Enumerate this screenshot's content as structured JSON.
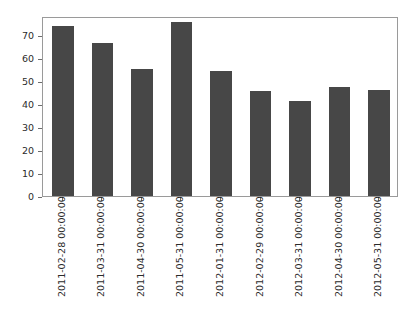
{
  "chart_data": {
    "type": "bar",
    "title": "",
    "xlabel": "",
    "ylabel": "",
    "categories": [
      "2011-02-28 00:00:00",
      "2011-03-31 00:00:00",
      "2011-04-30 00:00:00",
      "2011-05-31 00:00:00",
      "2012-01-31 00:00:00",
      "2012-02-29 00:00:00",
      "2012-03-31 00:00:00",
      "2012-04-30 00:00:00",
      "2012-05-31 00:00:00"
    ],
    "values": [
      74.0,
      66.5,
      55.3,
      75.5,
      54.2,
      45.8,
      41.4,
      47.5,
      46.2
    ],
    "yticks": [
      0,
      10,
      20,
      30,
      40,
      50,
      60,
      70
    ],
    "ytick_labels": [
      "0",
      "10",
      "20",
      "30",
      "40",
      "50",
      "60",
      "70"
    ],
    "ylim": [
      0,
      78.3
    ],
    "grid": false,
    "legend": null,
    "bar_color": "#474747",
    "axes_color": "#9a9a9a",
    "tick_color": "#6d6d6d",
    "background": "#ffffff"
  }
}
